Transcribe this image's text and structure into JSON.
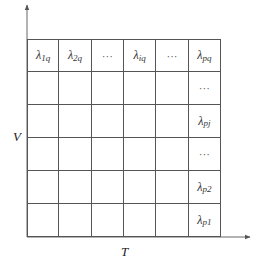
{
  "axes": {
    "x_label": "T",
    "y_label": "V"
  },
  "grid": {
    "rows": 6,
    "cols": 6,
    "cells": [
      [
        {
          "sym": "λ",
          "sub": "1q"
        },
        {
          "sym": "λ",
          "sub": "2q"
        },
        {
          "text": "···"
        },
        {
          "sym": "λ",
          "sub": "iq"
        },
        {
          "text": "···"
        },
        {
          "sym": "λ",
          "sub": "pq"
        }
      ],
      [
        {},
        {},
        {},
        {},
        {},
        {
          "text": "···"
        }
      ],
      [
        {},
        {},
        {},
        {},
        {},
        {
          "sym": "λ",
          "sub": "pj"
        }
      ],
      [
        {},
        {},
        {},
        {},
        {},
        {
          "text": "···"
        }
      ],
      [
        {},
        {},
        {},
        {},
        {},
        {
          "sym": "λ",
          "sub": "p2"
        }
      ],
      [
        {},
        {},
        {},
        {},
        {},
        {
          "sym": "λ",
          "sub": "p1"
        }
      ]
    ]
  }
}
